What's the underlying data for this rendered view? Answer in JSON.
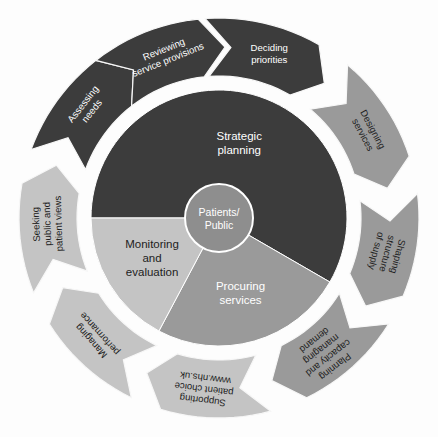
{
  "palette": {
    "dark": "#3c3c3c",
    "medium": "#9a9a9a",
    "light": "#c4c4c4",
    "hub": "#8e8e8e",
    "background": "#fdfdfd",
    "gap": "#ffffff",
    "text_light": "#ffffff",
    "text_dark": "#1d1d1d"
  },
  "hub": {
    "label_line1": "Patients/",
    "label_line2": "Public"
  },
  "segments": [
    {
      "id": "strategic-planning",
      "lines": [
        "Strategic",
        "planning"
      ],
      "tone": "dark",
      "text_tone": "light",
      "start_deg": 180,
      "end_deg": 390
    },
    {
      "id": "procuring-services",
      "lines": [
        "Procuring",
        "services"
      ],
      "tone": "medium",
      "text_tone": "light",
      "start_deg": 30,
      "end_deg": 118
    },
    {
      "id": "monitoring-and-evaluation",
      "lines": [
        "Monitoring",
        "and",
        "evaluation"
      ],
      "tone": "light",
      "text_tone": "dark",
      "start_deg": 118,
      "end_deg": 180
    }
  ],
  "arrows": [
    {
      "id": "deciding-priorities",
      "lines": [
        "Deciding",
        "priorities"
      ],
      "tone": "dark",
      "text_tone": "light",
      "center_deg": 287,
      "span_deg": 42,
      "text_rotate": 0
    },
    {
      "id": "designing-services",
      "lines": [
        "Designing",
        "services"
      ],
      "tone": "medium",
      "text_tone": "dark",
      "center_deg": 330,
      "span_deg": 40,
      "text_rotate": 62
    },
    {
      "id": "shaping-structure-of-supply",
      "lines": [
        "Shaping",
        "structure",
        "of supply"
      ],
      "tone": "medium",
      "text_tone": "dark",
      "center_deg": 12,
      "span_deg": 38,
      "text_rotate": 105
    },
    {
      "id": "planning-capacity-and-managing-demand",
      "lines": [
        "Planning",
        "capacity and",
        "managing",
        "demand"
      ],
      "tone": "medium",
      "text_tone": "dark",
      "center_deg": 52,
      "span_deg": 40,
      "text_rotate": 142
    },
    {
      "id": "supporting-patient-choice",
      "lines": [
        "Supporting",
        "patient choice",
        "www.nhs.uk"
      ],
      "tone": "light",
      "text_tone": "dark",
      "center_deg": 95,
      "span_deg": 40,
      "text_rotate": 187
    },
    {
      "id": "managing-performance",
      "lines": [
        "Managing",
        "performance"
      ],
      "tone": "light",
      "text_tone": "dark",
      "center_deg": 136,
      "span_deg": 40,
      "text_rotate": 228
    },
    {
      "id": "seeking-public-and-patient-views",
      "lines": [
        "Seeking",
        "public and",
        "patient views"
      ],
      "tone": "light",
      "text_tone": "dark",
      "center_deg": 178,
      "span_deg": 40,
      "text_rotate": 268
    },
    {
      "id": "assessing-needs",
      "lines": [
        "Assessing",
        "needs"
      ],
      "tone": "dark",
      "text_tone": "light",
      "center_deg": 220,
      "span_deg": 40,
      "text_rotate": 308
    },
    {
      "id": "reviewing-service-provisions",
      "lines": [
        "Reviewing",
        "service provisions"
      ],
      "tone": "dark",
      "text_tone": "light",
      "center_deg": 252,
      "span_deg": 40,
      "text_rotate": 338
    }
  ],
  "geometry": {
    "cx": 219,
    "cy": 218,
    "pie_radius": 128,
    "hub_radius": 34,
    "ring_inner": 142,
    "ring_outer": 200,
    "arrow_head_deg": 8
  }
}
